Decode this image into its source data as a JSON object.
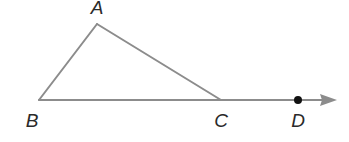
{
  "diagram": {
    "type": "geometry",
    "colors": {
      "line": "#8c8c8c",
      "point": "#111111",
      "label": "#2a2a2a",
      "background": "#ffffff"
    },
    "points": {
      "A": {
        "label": "A",
        "x": 97,
        "y": 24,
        "label_x": 97,
        "label_y": 14
      },
      "B": {
        "label": "B",
        "x": 39,
        "y": 100,
        "label_x": 32,
        "label_y": 127
      },
      "C": {
        "label": "C",
        "x": 221,
        "y": 100,
        "label_x": 221,
        "label_y": 127
      },
      "D": {
        "label": "D",
        "x": 298,
        "y": 100,
        "label_x": 298,
        "label_y": 127,
        "marked": true
      }
    },
    "segments": [
      {
        "from": "A",
        "to": "B"
      },
      {
        "from": "A",
        "to": "C"
      }
    ],
    "ray": {
      "from": "B",
      "through": [
        "C",
        "D"
      ],
      "arrow_end_x": 337,
      "arrow_end_y": 100
    }
  }
}
